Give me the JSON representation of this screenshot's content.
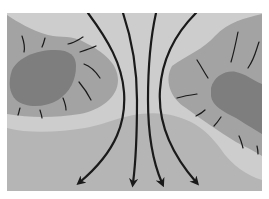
{
  "diagram": {
    "type": "flow-map",
    "description": "Grey-shaded landform map with four black flow arrows passing downward between two elevated masses",
    "colors": {
      "background": "#ffffff",
      "low_ground": "#b5b5b5",
      "mid_band": "#cdcdcd",
      "upland": "#9f9f9f",
      "core": "#7d7d7d",
      "lines": "#1a1a1a"
    },
    "arrows": [
      {
        "name": "flow-arrow-1",
        "direction": "down-left"
      },
      {
        "name": "flow-arrow-2",
        "direction": "down"
      },
      {
        "name": "flow-arrow-3",
        "direction": "down"
      },
      {
        "name": "flow-arrow-4",
        "direction": "down-right"
      }
    ],
    "regions": [
      {
        "name": "left-upland"
      },
      {
        "name": "left-core"
      },
      {
        "name": "right-upland"
      },
      {
        "name": "right-core"
      },
      {
        "name": "lowland"
      },
      {
        "name": "light-band"
      }
    ]
  }
}
